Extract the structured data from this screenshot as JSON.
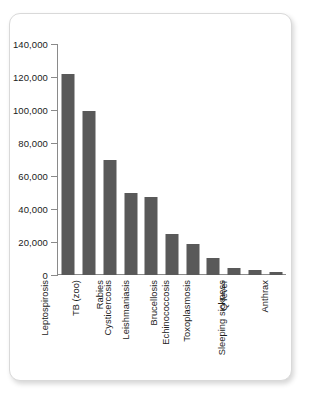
{
  "card": {
    "background_color": "#ffffff",
    "border_color": "#d9d9d9"
  },
  "chart_data": {
    "type": "bar",
    "title": "",
    "subtitle": "",
    "xlabel": "",
    "ylabel": "",
    "ylim": [
      0,
      140000
    ],
    "grid": false,
    "legend": false,
    "bar_color": "#595959",
    "axis_color": "#8a8a8a",
    "label_orientation": "vertical",
    "ytick_values": [
      0,
      20000,
      40000,
      60000,
      80000,
      100000,
      120000,
      140000
    ],
    "ytick_labels": [
      "0",
      "20,000",
      "40,000",
      "60,000",
      "80,000",
      "100,000",
      "120,000",
      "140,000"
    ],
    "categories": [
      "Leptospirosis",
      "TB (zoo)",
      "Rabies",
      "Cysticercosis",
      "Leishmaniasis",
      "Brucellosis",
      "Echinococcosis",
      "Toxoplasmosis",
      "Q fever",
      "Sleeping sickness",
      "Anthrax"
    ],
    "values": [
      122000,
      99500,
      69500,
      50000,
      47000,
      25000,
      18500,
      10500,
      4000,
      3000,
      1800
    ]
  }
}
